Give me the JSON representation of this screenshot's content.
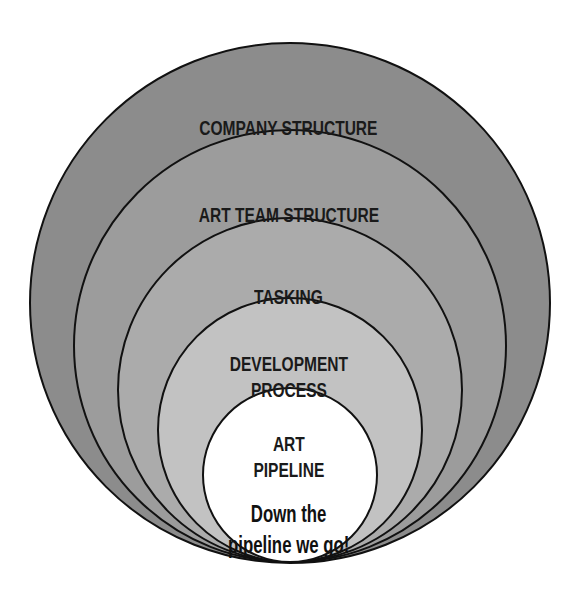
{
  "diagram": {
    "type": "nested-circles",
    "center_x": 290,
    "bottom_y": 563,
    "stroke_color": "#111111",
    "levels": [
      {
        "label": "COMPANY STRUCTURE",
        "radius": 261,
        "fill": "#8c8c8c",
        "label_top": 89
      },
      {
        "label": "ART TEAM STRUCTURE",
        "radius": 217,
        "fill": "#9c9c9c",
        "label_top": 176
      },
      {
        "label": "TASKING",
        "radius": 173,
        "fill": "#ababab",
        "label_top": 257
      },
      {
        "label": "DEVELOPMENT\nPROCESS",
        "radius": 133,
        "fill": "#c2c2c2",
        "label_top": 325
      },
      {
        "label": "ART\nPIPELINE",
        "radius": 88,
        "fill": "#ffffff",
        "label_top": 405,
        "sublabel": "Down the\npipeline we go!",
        "sublabel_top": 467
      }
    ]
  }
}
